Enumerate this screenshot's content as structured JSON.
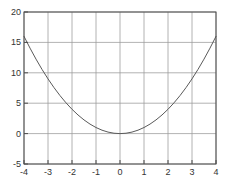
{
  "chart_data": {
    "type": "line",
    "title": "",
    "xlabel": "",
    "ylabel": "",
    "xlim": [
      -4,
      4
    ],
    "ylim": [
      -5,
      20
    ],
    "xticks": [
      -4,
      -3,
      -2,
      -1,
      0,
      1,
      2,
      3,
      4
    ],
    "yticks": [
      -5,
      0,
      5,
      10,
      15,
      20
    ],
    "grid": true,
    "legend": "none",
    "series": [
      {
        "name": "parabola",
        "x": [
          -4,
          -3.75,
          -3.5,
          -3.25,
          -3,
          -2.75,
          -2.5,
          -2.25,
          -2,
          -1.75,
          -1.5,
          -1.25,
          -1,
          -0.75,
          -0.5,
          -0.25,
          0,
          0.25,
          0.5,
          0.75,
          1,
          1.25,
          1.5,
          1.75,
          2,
          2.25,
          2.5,
          2.75,
          3,
          3.25,
          3.5,
          3.75,
          4
        ],
        "y": [
          16,
          14.0625,
          12.25,
          10.5625,
          9,
          7.5625,
          6.25,
          5.0625,
          4,
          3.0625,
          2.25,
          1.5625,
          1,
          0.5625,
          0.25,
          0.0625,
          0,
          0.0625,
          0.25,
          0.5625,
          1,
          1.5625,
          2.25,
          3.0625,
          4,
          5.0625,
          6.25,
          7.5625,
          9,
          10.5625,
          12.25,
          14.0625,
          16
        ]
      }
    ]
  },
  "colors": {
    "background": "#ffffff",
    "axis": "#4d4d4d",
    "grid": "#9a9a9a",
    "curve": "#5a5a5a",
    "tick_label": "#333333"
  }
}
